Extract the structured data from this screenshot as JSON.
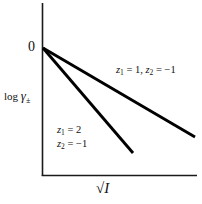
{
  "figure": {
    "background_color": "#ffffff",
    "ink_color": "#000000"
  },
  "axes": {
    "y_axis": {
      "title": "log",
      "symbol": "γ",
      "subscript": "±",
      "zero_tick_label": "0"
    },
    "x_axis": {
      "title_radical": "√",
      "title_radicand": "I"
    }
  },
  "annotations": {
    "series1": {
      "var1": "z",
      "var1_sub": "1",
      "var1_value": "= 1,",
      "var2": "z",
      "var2_sub": "2",
      "var2_value": "= −1"
    },
    "series2": {
      "line1_var": "z",
      "line1_sub": "1",
      "line1_value": "= 2",
      "line2_var": "z",
      "line2_sub": "2",
      "line2_value": "= −1"
    }
  },
  "chart_data": {
    "type": "line",
    "title": "",
    "xlabel": "√I",
    "ylabel": "log γ±",
    "xlim": [
      0,
      1
    ],
    "ylim": [
      -1,
      0.12
    ],
    "grid": false,
    "legend": "inline-annotations",
    "axis_ticks": {
      "x": [],
      "y": [
        "0"
      ]
    },
    "series": [
      {
        "name": "z1 = 1, z2 = -1",
        "label": "z₁ = 1, z₂ = −1",
        "z1": 1,
        "z2": -1,
        "slope": -0.68,
        "x": [
          0.0,
          1.0
        ],
        "y": [
          0.0,
          -0.68
        ],
        "endpoint_px": [
          195,
          137
        ]
      },
      {
        "name": "z1 = 2, z2 = -1",
        "label": "z₁ = 2, z₂ = −1",
        "z1": 2,
        "z2": -1,
        "slope": -1.4,
        "x": [
          0.0,
          0.59
        ],
        "y": [
          0.0,
          -0.83
        ],
        "endpoint_px": [
          133,
          153
        ]
      }
    ],
    "origin_px": [
      43,
      48
    ]
  }
}
